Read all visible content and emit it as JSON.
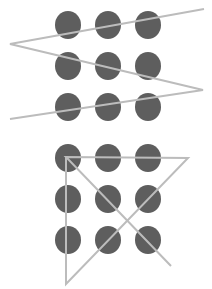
{
  "canvas": {
    "width": 212,
    "height": 289,
    "background": "#ffffff"
  },
  "colors": {
    "dot": "#5e5e5e",
    "line": "#bcbcbc"
  },
  "dot_radius_x": 13,
  "dot_radius_y": 14,
  "puzzles": [
    {
      "name": "zigzag-puzzle",
      "grid_columns_x": [
        68,
        108,
        148
      ],
      "grid_rows_y": [
        25,
        66,
        107
      ],
      "path": [
        [
          204,
          9
        ],
        [
          10,
          44
        ],
        [
          203,
          90
        ],
        [
          10,
          119
        ]
      ],
      "closed": false
    },
    {
      "name": "triangle-puzzle",
      "grid_columns_x": [
        68,
        108,
        148
      ],
      "grid_rows_y": [
        158,
        199,
        240
      ],
      "path": [
        [
          171,
          266
        ],
        [
          66,
          157
        ],
        [
          188,
          158
        ],
        [
          66,
          284
        ],
        [
          66,
          157
        ]
      ],
      "closed": false
    }
  ]
}
